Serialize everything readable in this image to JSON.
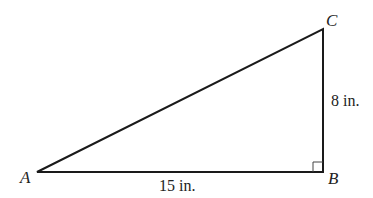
{
  "diagram": {
    "type": "right-triangle",
    "vertices": {
      "A": {
        "label": "A",
        "x": 37,
        "y": 172
      },
      "B": {
        "label": "B",
        "x": 323,
        "y": 172
      },
      "C": {
        "label": "C",
        "x": 323,
        "y": 29
      }
    },
    "right_angle_at": "B",
    "sides": {
      "AB": {
        "label": "15 in."
      },
      "BC": {
        "label": "8 in."
      }
    },
    "stroke_color": "#1a1a1a"
  }
}
